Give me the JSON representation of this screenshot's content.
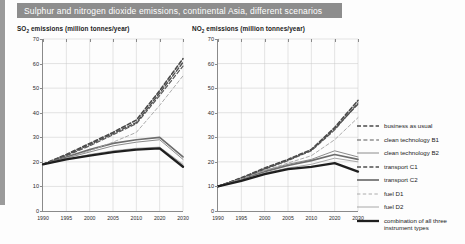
{
  "title": "Sulphur and nitrogen dioxide emissions, continental Asia, different scenarios",
  "panels": {
    "left": {
      "subtitle_prefix": "SO",
      "subtitle_sub": "2",
      "subtitle_rest": " emissions (million tonnes/year)"
    },
    "right": {
      "subtitle_prefix": "NO",
      "subtitle_sub": "2",
      "subtitle_rest": " emissions (million tonnes/year)"
    }
  },
  "legend": {
    "position": "right",
    "items": [
      {
        "label": "business as usual",
        "style": "dashed",
        "width": 1.6,
        "color": "#4a4a4a",
        "dash": "4,2.2"
      },
      {
        "label": "clean technology B1",
        "style": "dashed",
        "width": 1.2,
        "color": "#5a5a5a",
        "dash": "4,2.4"
      },
      {
        "label": "clean technology B2",
        "style": "solid",
        "width": 1.0,
        "color": "#8c8c8c",
        "dash": ""
      },
      {
        "label": "transport C1",
        "style": "dashed",
        "width": 1.4,
        "color": "#4f4f4f",
        "dash": "4,2.2"
      },
      {
        "label": "transport C2",
        "style": "solid",
        "width": 1.7,
        "color": "#6d6d6d",
        "dash": ""
      },
      {
        "label": "fuel D1",
        "style": "dashed",
        "width": 0.9,
        "color": "#a3a3a3",
        "dash": "3.4,2.4"
      },
      {
        "label": "fuel D2",
        "style": "solid",
        "width": 1.0,
        "color": "#a8a8a8",
        "dash": ""
      },
      {
        "label": "combination of all three\ninstrument types",
        "style": "solid",
        "width": 2.3,
        "color": "#1f1f1f",
        "dash": ""
      }
    ]
  },
  "chart_data": [
    {
      "id": "so2",
      "type": "line",
      "title": "SO2 emissions (million tonnes/year)",
      "xlabel": "",
      "ylabel": "million tonnes/year",
      "xticks": [
        1990,
        1995,
        2000,
        2005,
        2010,
        2020,
        2030
      ],
      "yticks": [
        0,
        10,
        20,
        30,
        40,
        50,
        60,
        70
      ],
      "xlim": [
        1990,
        2030
      ],
      "ylim": [
        0,
        70
      ],
      "grid": true,
      "x": [
        1990,
        1995,
        2000,
        2005,
        2010,
        2020,
        2030
      ],
      "series": [
        {
          "name": "business as usual",
          "values": [
            19,
            23,
            27.5,
            32,
            37,
            49,
            62
          ]
        },
        {
          "name": "clean technology B1",
          "values": [
            19,
            22.5,
            26.5,
            31,
            35.5,
            47,
            59
          ]
        },
        {
          "name": "clean technology B2",
          "values": [
            19,
            21.5,
            24,
            26.5,
            28,
            29,
            21
          ]
        },
        {
          "name": "transport C1",
          "values": [
            19,
            22.8,
            27,
            31.5,
            36,
            48,
            60.5
          ]
        },
        {
          "name": "transport C2",
          "values": [
            19,
            22,
            25,
            27.5,
            29,
            30,
            22
          ]
        },
        {
          "name": "fuel D1",
          "values": [
            19,
            21.5,
            24.5,
            28,
            32,
            43,
            55
          ]
        },
        {
          "name": "fuel D2",
          "values": [
            19,
            21,
            23,
            24.5,
            25.5,
            26,
            19
          ]
        },
        {
          "name": "combination of all three instrument types",
          "values": [
            19,
            21,
            22.5,
            24,
            25,
            25.5,
            18
          ]
        }
      ]
    },
    {
      "id": "nox",
      "type": "line",
      "title": "NO2 emissions (million tonnes/year)",
      "xlabel": "",
      "ylabel": "million tonnes/year",
      "xticks": [
        1990,
        1995,
        2000,
        2005,
        2010,
        2020,
        2030
      ],
      "yticks": [
        0,
        10,
        20,
        30,
        40,
        50,
        60,
        70
      ],
      "xlim": [
        1990,
        2030
      ],
      "ylim": [
        0,
        70
      ],
      "grid": true,
      "x": [
        1990,
        1995,
        2000,
        2005,
        2010,
        2020,
        2030
      ],
      "series": [
        {
          "name": "business as usual",
          "values": [
            10,
            13.5,
            17.5,
            21,
            25,
            34,
            45
          ]
        },
        {
          "name": "clean technology B1",
          "values": [
            10,
            13.2,
            17,
            20.5,
            24.5,
            33,
            44
          ]
        },
        {
          "name": "clean technology B2",
          "values": [
            10,
            13,
            16.5,
            19,
            21,
            24.5,
            22
          ]
        },
        {
          "name": "transport C1",
          "values": [
            10,
            13.4,
            17.2,
            20.8,
            24.8,
            33.5,
            43.5
          ]
        },
        {
          "name": "transport C2",
          "values": [
            10,
            12.8,
            16,
            18.5,
            20.5,
            23,
            21
          ]
        },
        {
          "name": "fuel D1",
          "values": [
            10,
            13,
            16.5,
            19.5,
            22.5,
            29,
            38
          ]
        },
        {
          "name": "fuel D2",
          "values": [
            10,
            12.5,
            15.5,
            17.5,
            19,
            21.5,
            20
          ]
        },
        {
          "name": "combination of all three instrument types",
          "values": [
            10,
            12.3,
            15,
            17,
            18,
            19.5,
            16
          ]
        }
      ]
    }
  ]
}
